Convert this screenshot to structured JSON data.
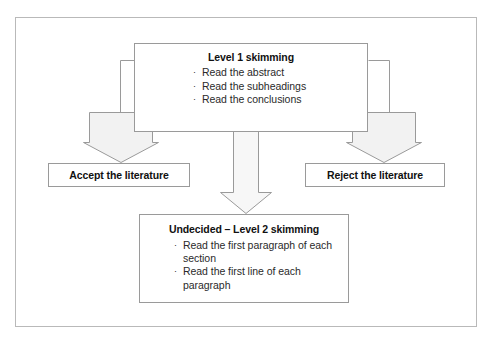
{
  "diagram": {
    "frame": {
      "border_color": "#b9b9b9"
    },
    "palette": {
      "box_border": "#9a9a9a",
      "arrow_fill": "#f2f2f2",
      "arrow_stroke": "#9a9a9a",
      "connector_stroke": "#9a9a9a",
      "text": "#111111",
      "bullet_text": "#2a2a2a"
    },
    "nodes": {
      "level1": {
        "id": "level-1-skimming",
        "title": "Level 1 skimming",
        "bullets": [
          "Read the abstract",
          "Read the subheadings",
          "Read the conclusions"
        ]
      },
      "accept": {
        "id": "accept-the-literature",
        "label": "Accept the literature"
      },
      "reject": {
        "id": "reject-the-literature",
        "label": "Reject the literature"
      },
      "undecided": {
        "id": "undecided-level-2-skimming",
        "title": "Undecided – Level 2 skimming",
        "bullets": [
          "Read the first paragraph of each section",
          "Read the first line of each paragraph"
        ]
      }
    },
    "bullet_glyph": "·",
    "arrows": [
      {
        "name": "arrow-to-accept",
        "direction": "down",
        "from": "level1",
        "to": "accept"
      },
      {
        "name": "arrow-to-reject",
        "direction": "down",
        "from": "level1",
        "to": "reject"
      },
      {
        "name": "arrow-to-undecided",
        "direction": "down",
        "from": "level1",
        "to": "undecided"
      }
    ]
  }
}
